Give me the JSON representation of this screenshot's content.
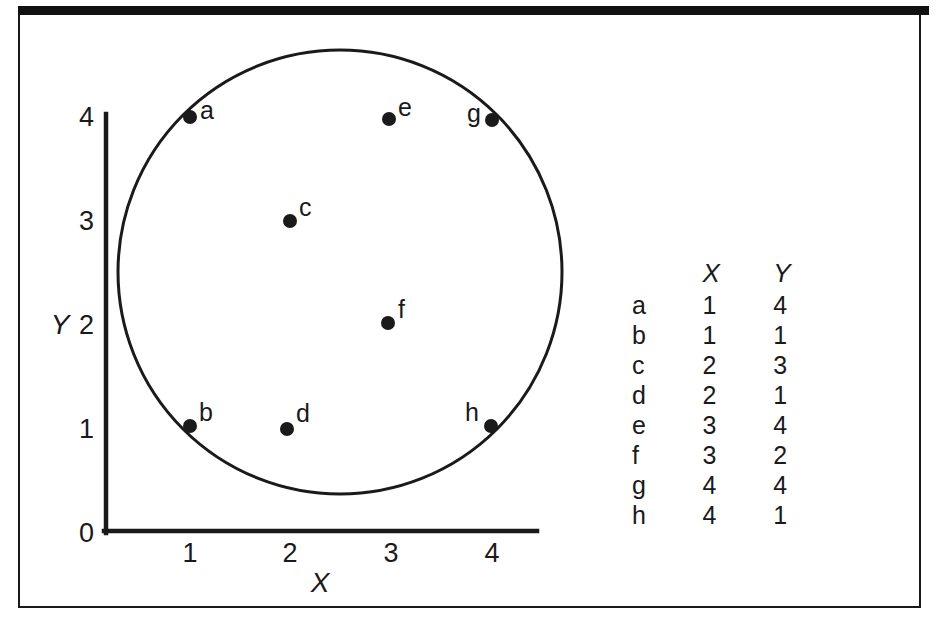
{
  "figure": {
    "background_color": "#ffffff",
    "ink_color": "#1a1a1a",
    "frame_color": "#111111"
  },
  "chart_data": {
    "type": "scatter",
    "title": "",
    "xlabel": "X",
    "ylabel": "Y",
    "xlim": [
      0,
      4.35
    ],
    "ylim": [
      0,
      4.15
    ],
    "xticks": [
      "0",
      "1",
      "2",
      "3",
      "4"
    ],
    "yticks": [
      "0",
      "1",
      "2",
      "3",
      "4"
    ],
    "grid": false,
    "legend": "none",
    "annotations": {
      "enclosing_shape": "circle",
      "circle_center_px": [
        340,
        272
      ],
      "circle_radius_px": 222
    },
    "points": [
      {
        "label": "a",
        "x": 1,
        "y": 4,
        "label_side": "right"
      },
      {
        "label": "b",
        "x": 1,
        "y": 1,
        "label_side": "right"
      },
      {
        "label": "c",
        "x": 2,
        "y": 3,
        "label_side": "right"
      },
      {
        "label": "d",
        "x": 2,
        "y": 1,
        "label_side": "right"
      },
      {
        "label": "e",
        "x": 3,
        "y": 4,
        "label_side": "right"
      },
      {
        "label": "f",
        "x": 3,
        "y": 2,
        "label_side": "right"
      },
      {
        "label": "g",
        "x": 4,
        "y": 4,
        "label_side": "left"
      },
      {
        "label": "h",
        "x": 4,
        "y": 1,
        "label_side": "left"
      }
    ]
  },
  "axis": {
    "x_title": "X",
    "y_title": "Y",
    "x_tick_labels": [
      "0",
      "1",
      "2",
      "3",
      "4"
    ],
    "y_tick_labels": [
      "0",
      "1",
      "2",
      "3",
      "4"
    ]
  },
  "table": {
    "headers": {
      "key": "",
      "x": "X",
      "y": "Y"
    },
    "rows": [
      {
        "key": "a",
        "x": "1",
        "y": "4"
      },
      {
        "key": "b",
        "x": "1",
        "y": "1"
      },
      {
        "key": "c",
        "x": "2",
        "y": "3"
      },
      {
        "key": "d",
        "x": "2",
        "y": "1"
      },
      {
        "key": "e",
        "x": "3",
        "y": "4"
      },
      {
        "key": "f",
        "x": "3",
        "y": "2"
      },
      {
        "key": "g",
        "x": "4",
        "y": "4"
      },
      {
        "key": "h",
        "x": "4",
        "y": "1"
      }
    ]
  }
}
